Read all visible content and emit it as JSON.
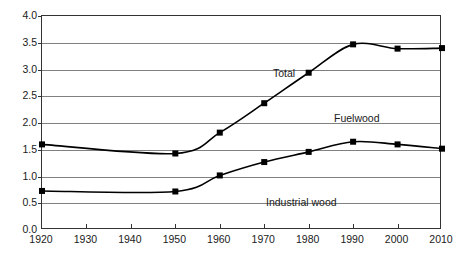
{
  "chart_data": {
    "type": "line",
    "title": "",
    "subtitle": "",
    "xlabel": "",
    "ylabel": "",
    "xlim": [
      1920,
      2010
    ],
    "ylim": [
      0.0,
      4.0
    ],
    "grid": true,
    "legend_position": "inline-annotations",
    "x": [
      1920,
      1950,
      1960,
      1970,
      1980,
      1990,
      2000,
      2010
    ],
    "xticks": [
      "1920",
      "1930",
      "1940",
      "1950",
      "1960",
      "1970",
      "1980",
      "1990",
      "2000",
      "2010"
    ],
    "xtick_values": [
      1920,
      1930,
      1940,
      1950,
      1960,
      1970,
      1980,
      1990,
      2000,
      2010
    ],
    "yticks": [
      "0.0",
      "0.5",
      "1.0",
      "1.5",
      "2.0",
      "2.5",
      "3.0",
      "3.5",
      "4.0"
    ],
    "ytick_values": [
      0.0,
      0.5,
      1.0,
      1.5,
      2.0,
      2.5,
      3.0,
      3.5,
      4.0
    ],
    "series": [
      {
        "name": "Total",
        "color": "#000000",
        "marker": "square",
        "values": [
          1.6,
          1.43,
          1.82,
          2.37,
          2.94,
          3.47,
          3.39,
          3.4
        ]
      },
      {
        "name": "Fuelwood",
        "color": "#000000",
        "marker": "square",
        "values": [
          0.73,
          0.72,
          1.02,
          1.27,
          1.46,
          1.65,
          1.6,
          1.52
        ]
      }
    ],
    "annotations": [
      {
        "text": "Total",
        "x_px": 272,
        "y_px": 67
      },
      {
        "text": "Fuelwood",
        "x_px": 333,
        "y_px": 112
      },
      {
        "text": "Industrial wood",
        "x_px": 265,
        "y_px": 196
      }
    ]
  }
}
